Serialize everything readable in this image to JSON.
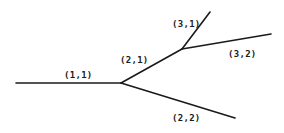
{
  "diagram": {
    "type": "tree",
    "colors": {
      "background": "#ffffff",
      "stroke": "#1a1a1a",
      "text": "#1a1a1a"
    },
    "nodes": {
      "start": {
        "x": 16,
        "y": 83
      },
      "n1": {
        "x": 121,
        "y": 83
      },
      "n2": {
        "x": 182,
        "y": 49
      },
      "leaf_3_1": {
        "x": 210,
        "y": 12
      },
      "leaf_3_2": {
        "x": 271,
        "y": 34
      },
      "leaf_2_2": {
        "x": 235,
        "y": 118
      }
    },
    "edges": [
      {
        "id": "e11",
        "label": "(1,1)",
        "from": "start",
        "to": "n1",
        "x1": 16,
        "y1": 83,
        "x2": 121,
        "y2": 83,
        "label_x": 64,
        "label_y": 78
      },
      {
        "id": "e21",
        "label": "(2,1)",
        "from": "n1",
        "to": "n2",
        "x1": 121,
        "y1": 83,
        "x2": 182,
        "y2": 49,
        "label_x": 120,
        "label_y": 63
      },
      {
        "id": "e22",
        "label": "(2,2)",
        "from": "n1",
        "to": "leaf_2_2",
        "x1": 121,
        "y1": 83,
        "x2": 235,
        "y2": 118,
        "label_x": 172,
        "label_y": 121
      },
      {
        "id": "e31",
        "label": "(3,1)",
        "from": "n2",
        "to": "leaf_3_1",
        "x1": 182,
        "y1": 49,
        "x2": 210,
        "y2": 12,
        "label_x": 172,
        "label_y": 27
      },
      {
        "id": "e32",
        "label": "(3,2)",
        "from": "n2",
        "to": "leaf_3_2",
        "x1": 182,
        "y1": 49,
        "x2": 271,
        "y2": 34,
        "label_x": 228,
        "label_y": 57
      }
    ]
  }
}
